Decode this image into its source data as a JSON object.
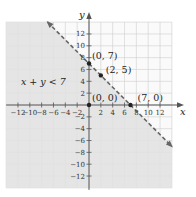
{
  "chart_data": {
    "type": "line",
    "title": "",
    "xlabel": "x",
    "ylabel": "y",
    "xlim": [
      -14,
      14
    ],
    "ylim": [
      -14,
      14
    ],
    "grid": true,
    "x_ticks": [
      -12,
      -10,
      -8,
      -6,
      -4,
      -2,
      2,
      4,
      6,
      8,
      10,
      12
    ],
    "y_ticks": [
      12,
      10,
      8,
      6,
      4,
      2,
      -2,
      -4,
      -6,
      -8,
      -10,
      -12
    ],
    "x_tick_labels": [
      "−12",
      "−10",
      "−8",
      "−6",
      "−4",
      "−2",
      "2",
      "4",
      "6",
      "8",
      "10",
      "12"
    ],
    "y_tick_labels": [
      "12",
      "10",
      "8",
      "6",
      "4",
      "2",
      "−2",
      "−4",
      "−6",
      "−8",
      "−10",
      "−12"
    ],
    "boundary_line": {
      "equation": "x + y = 7",
      "style": "dashed",
      "from": [
        -7,
        14
      ],
      "to": [
        14,
        -7
      ],
      "color": "#666666"
    },
    "shaded_region": {
      "inequality": "x + y < 7",
      "side": "below-left",
      "color": "#e2e2e2"
    },
    "points": [
      {
        "x": 0,
        "y": 7,
        "label": "(0, 7)"
      },
      {
        "x": 2,
        "y": 5,
        "label": "(2, 5)"
      },
      {
        "x": 0,
        "y": 0,
        "label": "(0, 0)"
      },
      {
        "x": 7,
        "y": 0,
        "label": "(7, 0)"
      }
    ],
    "annotations": [
      {
        "text": "x + y < 7",
        "x": -11.5,
        "y": 3.3
      }
    ]
  },
  "colors": {
    "shade": "#e2e2e2",
    "unshaded": "#fafafa",
    "grid": "#cfcfcf",
    "axis": "#555555",
    "line": "#6a6a6a",
    "point": "#222222"
  }
}
